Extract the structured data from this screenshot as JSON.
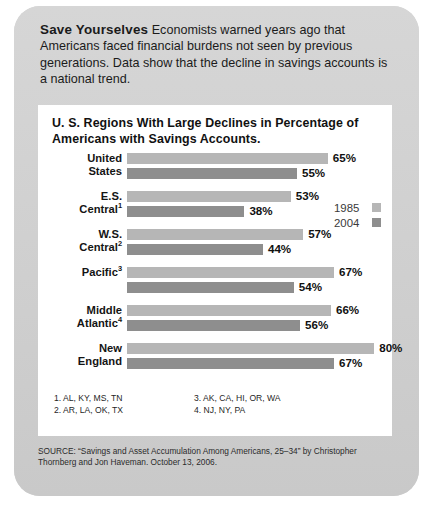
{
  "headline": {
    "strong": "Save Yourselves",
    "deck": "Economists warned years ago that Americans faced financial burdens not seen by previous generations. Data show that the decline in savings accounts is a national trend."
  },
  "chart_data": {
    "type": "bar",
    "orientation": "horizontal",
    "title": "U. S. Regions With Large Declines in Percentage of Americans with Savings Accounts.",
    "categories": [
      "United States",
      "E.S. Central",
      "W.S. Central",
      "Pacific",
      "Middle Atlantic",
      "New England"
    ],
    "category_lines": [
      [
        "United",
        "States"
      ],
      [
        "E.S.",
        "Central"
      ],
      [
        "W.S.",
        "Central"
      ],
      [
        "Pacific",
        ""
      ],
      [
        "Middle",
        "Atlantic"
      ],
      [
        "New",
        "England"
      ]
    ],
    "category_footnote_marks": [
      "",
      "1",
      "2",
      "3",
      "4",
      ""
    ],
    "series": [
      {
        "name": "1985",
        "color": "#b6b6b6",
        "values": [
          65,
          53,
          57,
          67,
          66,
          80
        ]
      },
      {
        "name": "2004",
        "color": "#8e8e8e",
        "values": [
          55,
          38,
          44,
          54,
          56,
          67
        ]
      }
    ],
    "value_labels": [
      [
        "65%",
        "55%"
      ],
      [
        "53%",
        "38%"
      ],
      [
        "57%",
        "44%"
      ],
      [
        "67%",
        "54%"
      ],
      [
        "66%",
        "56%"
      ],
      [
        "80%",
        "67%"
      ]
    ],
    "xlabel": "",
    "ylabel": "",
    "xlim": [
      0,
      82
    ],
    "grid": false,
    "legend_position": "right",
    "units": "percent"
  },
  "legend": [
    {
      "label": "1985",
      "color": "#b6b6b6"
    },
    {
      "label": "2004",
      "color": "#8e8e8e"
    }
  ],
  "footnotes": {
    "left": [
      "1. AL, KY, MS, TN",
      "2. AR, LA, OK, TX"
    ],
    "right": [
      "3. AK, CA, HI, OR, WA",
      "4. NJ, NY, PA"
    ]
  },
  "source": "SOURCE: “Savings and Asset Accumulation Among Americans, 25–34” by Christopher Thornberg and Jon Haveman. October 13, 2006."
}
